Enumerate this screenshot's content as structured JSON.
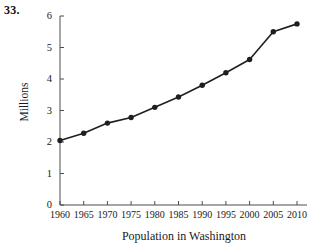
{
  "problem": {
    "number": "33."
  },
  "chart_data": {
    "type": "line",
    "title": "",
    "xlabel": "Population in Washington",
    "ylabel": "Millions",
    "categories": [
      "1960",
      "1965",
      "1970",
      "1975",
      "1980",
      "1985",
      "1990",
      "1995",
      "2000",
      "2005",
      "2010"
    ],
    "x": [
      1960,
      1965,
      1970,
      1975,
      1980,
      1985,
      1990,
      1995,
      2000,
      2005,
      2010
    ],
    "values": [
      2.05,
      2.28,
      2.6,
      2.78,
      3.1,
      3.43,
      3.8,
      4.2,
      4.62,
      5.5,
      5.75
    ],
    "xlim": [
      1960,
      2012
    ],
    "ylim": [
      0,
      6.2
    ],
    "yticks": [
      0,
      1,
      2,
      3,
      4,
      5,
      6
    ],
    "ytick_labels": [
      "0",
      "1",
      "2",
      "3",
      "4",
      "5",
      "6"
    ],
    "xticks": [
      1960,
      1965,
      1970,
      1975,
      1980,
      1985,
      1990,
      1995,
      2000,
      2005,
      2010
    ],
    "xtick_labels": [
      "1960",
      "1965",
      "1970",
      "1975",
      "1980",
      "1985",
      "1990",
      "1995",
      "2000",
      "2005",
      "2010"
    ],
    "grid": false,
    "legend": "none",
    "marker": "filled-circle",
    "line_color": "#1f1f1f",
    "marker_color": "#1f1f1f",
    "axis_color": "#4d4d4d"
  }
}
